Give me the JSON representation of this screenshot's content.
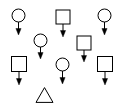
{
  "canvas": {
    "width": 122,
    "height": 109,
    "background_color": "#ffffff",
    "stroke_color": "#000000",
    "fill_color": "#ffffff",
    "arrow_color": "#000000"
  },
  "diagram": {
    "title": "",
    "node_count": 8,
    "arrow_count": 7,
    "nodes": [
      {
        "id": "node-1",
        "shape": "circle",
        "cx": 18.5,
        "cy": 15.5,
        "r": 6.5,
        "size": 13,
        "label": "",
        "has_arrow": true,
        "arrow_direction": "down",
        "arrow_from_y": 22,
        "arrow_to_y": 35
      },
      {
        "id": "node-2",
        "shape": "square",
        "cx": 63,
        "cy": 17,
        "size": 14,
        "label": "",
        "has_arrow": true,
        "arrow_direction": "down",
        "arrow_from_y": 24,
        "arrow_to_y": 37
      },
      {
        "id": "node-3",
        "shape": "circle",
        "cx": 104.5,
        "cy": 15.5,
        "r": 6.5,
        "size": 13,
        "label": "",
        "has_arrow": true,
        "arrow_direction": "down",
        "arrow_from_y": 22,
        "arrow_to_y": 35
      },
      {
        "id": "node-4",
        "shape": "circle",
        "cx": 40.5,
        "cy": 40.5,
        "r": 6.5,
        "size": 13,
        "label": "",
        "has_arrow": true,
        "arrow_direction": "down",
        "arrow_from_y": 47,
        "arrow_to_y": 59
      },
      {
        "id": "node-5",
        "shape": "square",
        "cx": 84,
        "cy": 43,
        "size": 14,
        "label": "",
        "has_arrow": true,
        "arrow_direction": "down",
        "arrow_from_y": 50,
        "arrow_to_y": 62
      },
      {
        "id": "node-6",
        "shape": "square",
        "cx": 19,
        "cy": 64,
        "size": 15,
        "label": "",
        "has_arrow": true,
        "arrow_direction": "down",
        "arrow_from_y": 72,
        "arrow_to_y": 85
      },
      {
        "id": "node-7",
        "shape": "circle",
        "cx": 62.5,
        "cy": 64.5,
        "r": 6.5,
        "size": 13,
        "label": "",
        "has_arrow": true,
        "arrow_direction": "down",
        "arrow_from_y": 71,
        "arrow_to_y": 84
      },
      {
        "id": "node-8",
        "shape": "square",
        "cx": 105,
        "cy": 64,
        "size": 15,
        "label": "",
        "has_arrow": true,
        "arrow_direction": "down",
        "arrow_from_y": 72,
        "arrow_to_y": 85
      },
      {
        "id": "node-9",
        "shape": "triangle",
        "cx": 44.5,
        "cy": 95,
        "size": 17,
        "label": "",
        "has_arrow": false,
        "arrow_direction": "",
        "arrow_from_y": 0,
        "arrow_to_y": 0
      }
    ]
  }
}
